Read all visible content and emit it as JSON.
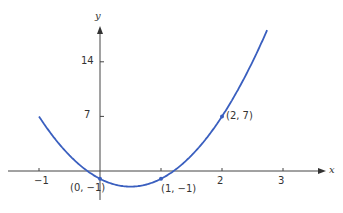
{
  "chart_data": {
    "type": "line",
    "title": "",
    "xlabel": "x",
    "ylabel": "y",
    "function": "y = 4x^2 - 4x - 1",
    "x_ticks": [
      -1,
      1,
      2,
      3
    ],
    "x_tick_labels": [
      "−1",
      "",
      "2",
      "3"
    ],
    "y_ticks": [
      7,
      14
    ],
    "y_tick_labels": [
      "7",
      "14"
    ],
    "xlim": [
      -1.5,
      3.8
    ],
    "ylim": [
      -5,
      22
    ],
    "grid": false,
    "series": [
      {
        "name": "parabola",
        "color": "#3a5fbf",
        "x": [
          -1,
          -0.5,
          0,
          0.5,
          1,
          1.5,
          2,
          2.5,
          2.75
        ],
        "y": [
          7,
          2,
          -1,
          -2,
          -1,
          2,
          7,
          14,
          18.25
        ]
      }
    ],
    "points": [
      {
        "x": 0,
        "y": -1,
        "label": "(0, −1)"
      },
      {
        "x": 1,
        "y": -1,
        "label": "(1, −1)"
      },
      {
        "x": 2,
        "y": 7,
        "label": "(2, 7)"
      }
    ]
  }
}
